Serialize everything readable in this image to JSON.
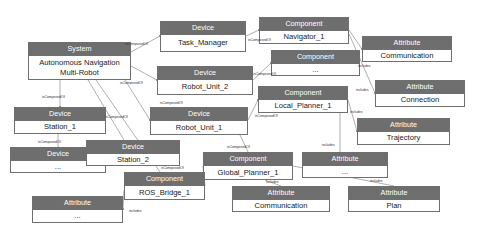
{
  "diagram": {
    "colors": {
      "header_fill": "#6e6e6e",
      "header_text": "#ffffff",
      "body_fill": "#ffffff",
      "border": "#6f6f6f",
      "edge": "#8d8d8d",
      "label_text": "#3a3a3a"
    },
    "relations": {
      "composed": "isComposedOf",
      "includes": "includes"
    },
    "nodes": [
      {
        "id": "system",
        "type": "System",
        "name": "Autonomous Navigation\nMulti-Robot",
        "x": 28,
        "y": 42,
        "w": 103,
        "h": 38
      },
      {
        "id": "task_manager",
        "type": "Device",
        "name": "Task_Manager",
        "x": 160,
        "y": 21,
        "w": 86,
        "h": 31
      },
      {
        "id": "robot_unit_2",
        "type": "Device",
        "name": "Robot_Unit_2",
        "x": 157,
        "y": 66,
        "w": 96,
        "h": 29
      },
      {
        "id": "robot_unit_1",
        "type": "Device",
        "name": "Robot_Unit_1",
        "x": 150,
        "y": 107,
        "w": 98,
        "h": 28
      },
      {
        "id": "station_1",
        "type": "Device",
        "name": "Station_1",
        "x": 14,
        "y": 107,
        "w": 92,
        "h": 27
      },
      {
        "id": "device_etc",
        "type": "Device",
        "name": "...",
        "x": 10,
        "y": 147,
        "w": 96,
        "h": 26
      },
      {
        "id": "station_2",
        "type": "Device",
        "name": "Station_2",
        "x": 86,
        "y": 140,
        "w": 94,
        "h": 26
      },
      {
        "id": "navigator_1",
        "type": "Component",
        "name": "Navigator_1",
        "x": 259,
        "y": 17,
        "w": 90,
        "h": 27
      },
      {
        "id": "comp_etc",
        "type": "Component",
        "name": "...",
        "x": 271,
        "y": 50,
        "w": 89,
        "h": 26
      },
      {
        "id": "local_planner",
        "type": "Component",
        "name": "Local_Planner_1",
        "x": 258,
        "y": 86,
        "w": 90,
        "h": 27
      },
      {
        "id": "global_planner",
        "type": "Component",
        "name": "Global_Planner_1",
        "x": 203,
        "y": 152,
        "w": 90,
        "h": 28
      },
      {
        "id": "ros_bridge",
        "type": "Component",
        "name": "ROS_Bridge_1",
        "x": 124,
        "y": 172,
        "w": 81,
        "h": 28
      },
      {
        "id": "attr_comm_top",
        "type": "Attribute",
        "name": "Communication",
        "x": 362,
        "y": 36,
        "w": 90,
        "h": 26
      },
      {
        "id": "attr_conn",
        "type": "Attribute",
        "name": "Connection",
        "x": 375,
        "y": 80,
        "w": 90,
        "h": 27
      },
      {
        "id": "attr_traj",
        "type": "Attribute",
        "name": "Trajectory",
        "x": 357,
        "y": 118,
        "w": 93,
        "h": 27
      },
      {
        "id": "attr_etc_mid",
        "type": "Attribute",
        "name": "...",
        "x": 302,
        "y": 152,
        "w": 86,
        "h": 26
      },
      {
        "id": "attr_comm_bot",
        "type": "Attribute",
        "name": "Communication",
        "x": 232,
        "y": 186,
        "w": 98,
        "h": 26
      },
      {
        "id": "attr_plan",
        "type": "Attribute",
        "name": "Plan",
        "x": 348,
        "y": 186,
        "w": 92,
        "h": 26
      },
      {
        "id": "attr_etc_left",
        "type": "Attribute",
        "name": "...",
        "x": 32,
        "y": 196,
        "w": 91,
        "h": 27
      }
    ],
    "edge_labels": [
      {
        "id": "el1",
        "text": "isComposedOf",
        "x": 125,
        "y": 42
      },
      {
        "id": "el2",
        "text": "isComposedOf",
        "x": 120,
        "y": 81
      },
      {
        "id": "el3",
        "text": "isComposedOf",
        "x": 160,
        "y": 101
      },
      {
        "id": "el4",
        "text": "isComposedOf",
        "x": 42,
        "y": 95
      },
      {
        "id": "el5",
        "text": "isComposedOf",
        "x": 105,
        "y": 115
      },
      {
        "id": "el6",
        "text": "isComposedOf",
        "x": 38,
        "y": 140
      },
      {
        "id": "el7",
        "text": "isComposedOf",
        "x": 248,
        "y": 38
      },
      {
        "id": "el8",
        "text": "isComposedOf",
        "x": 253,
        "y": 72
      },
      {
        "id": "el9",
        "text": "isComposedOf",
        "x": 255,
        "y": 114
      },
      {
        "id": "el10",
        "text": "isComposedOf",
        "x": 161,
        "y": 166
      },
      {
        "id": "el11",
        "text": "isComposedOf",
        "x": 227,
        "y": 145
      },
      {
        "id": "el12",
        "text": "includes",
        "x": 358,
        "y": 64
      },
      {
        "id": "el13",
        "text": "includes",
        "x": 356,
        "y": 88
      },
      {
        "id": "el14",
        "text": "includes",
        "x": 350,
        "y": 110
      },
      {
        "id": "el15",
        "text": "includes",
        "x": 322,
        "y": 143
      },
      {
        "id": "el16",
        "text": "includes",
        "x": 266,
        "y": 180
      },
      {
        "id": "el17",
        "text": "includes",
        "x": 370,
        "y": 179
      },
      {
        "id": "el18",
        "text": "includes",
        "x": 129,
        "y": 209
      }
    ]
  }
}
